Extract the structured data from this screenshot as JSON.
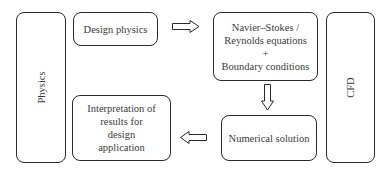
{
  "diagram": {
    "side_labels": {
      "left": "Physics",
      "right": "CFD"
    },
    "nodes": {
      "design_physics": {
        "lines": [
          "Design physics"
        ]
      },
      "equations": {
        "lines": [
          "Navier–Stokes /",
          "Reynolds equations",
          "+",
          "Boundary conditions"
        ]
      },
      "numerical_solution": {
        "lines": [
          "Numerical solution"
        ]
      },
      "interpretation": {
        "lines": [
          "Interpretation of",
          "results for",
          "design",
          "application"
        ]
      }
    },
    "edges": [
      {
        "from": "design_physics",
        "to": "equations",
        "direction": "right"
      },
      {
        "from": "equations",
        "to": "numerical_solution",
        "direction": "down"
      },
      {
        "from": "numerical_solution",
        "to": "interpretation",
        "direction": "left"
      }
    ],
    "colors": {
      "stroke": "#2a2a2a",
      "text": "#3a3a3a",
      "background": "#ffffff"
    }
  }
}
